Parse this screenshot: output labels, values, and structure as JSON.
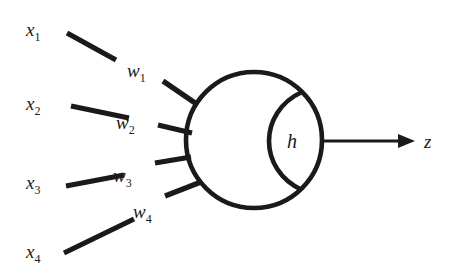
{
  "figure": {
    "background_color": "#ffffff",
    "ink_color": "#1a1a1a"
  },
  "inputs": [
    {
      "base": "x",
      "subscript": "1",
      "label": "x",
      "sub": "1"
    },
    {
      "base": "x",
      "subscript": "2",
      "label": "x",
      "sub": "2"
    },
    {
      "base": "x",
      "subscript": "3",
      "label": "x",
      "sub": "3"
    },
    {
      "base": "x",
      "subscript": "4",
      "label": "x",
      "sub": "4"
    }
  ],
  "weights": [
    {
      "base": "w",
      "subscript": "1",
      "label": "w",
      "sub": "1"
    },
    {
      "base": "w",
      "subscript": "2",
      "label": "w",
      "sub": "2"
    },
    {
      "base": "w",
      "subscript": "3",
      "label": "w",
      "sub": "3"
    },
    {
      "base": "w",
      "subscript": "4",
      "label": "w",
      "sub": "4"
    }
  ],
  "soma": {
    "activation_label": "h"
  },
  "output": {
    "label": "z",
    "arrow_icon": "arrow-right-icon"
  }
}
